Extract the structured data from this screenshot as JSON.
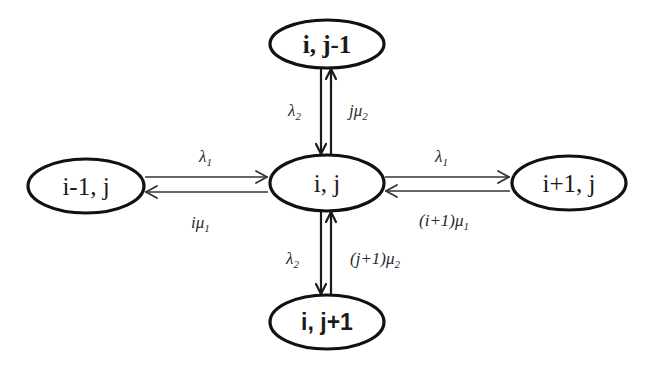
{
  "diagram": {
    "type": "state-transition",
    "nodes": [
      {
        "id": "top",
        "label": "i, j-1",
        "cx": 327,
        "cy": 44
      },
      {
        "id": "center",
        "label": "i, j",
        "cx": 327,
        "cy": 183
      },
      {
        "id": "left",
        "label": "i-1, j",
        "cx": 86,
        "cy": 186
      },
      {
        "id": "right",
        "label": "i+1, j",
        "cx": 569,
        "cy": 183
      },
      {
        "id": "bottom",
        "label": "i, j+1",
        "cx": 327,
        "cy": 322
      }
    ],
    "edges": [
      {
        "from": "top",
        "to": "center",
        "label": "λ₂"
      },
      {
        "from": "center",
        "to": "top",
        "label": "jμ₂"
      },
      {
        "from": "left",
        "to": "center",
        "label": "λ₁"
      },
      {
        "from": "center",
        "to": "left",
        "label": "iμ₁"
      },
      {
        "from": "center",
        "to": "right",
        "label": "λ₁"
      },
      {
        "from": "right",
        "to": "center",
        "label": "(i+1)μ₁"
      },
      {
        "from": "center",
        "to": "bottom",
        "label": "λ₂"
      },
      {
        "from": "bottom",
        "to": "center",
        "label": "(j+1)μ₂"
      }
    ]
  },
  "labels": {
    "node_top": "i, j-1",
    "node_center": "i, j",
    "node_left": "i-1, j",
    "node_right": "i+1, j",
    "node_bottom": "i, j+1",
    "rate_top_down": "λ",
    "rate_top_down_sub": "2",
    "rate_top_up": "jμ",
    "rate_top_up_sub": "2",
    "rate_left_right": "λ",
    "rate_left_right_sub": "1",
    "rate_left_back": "iμ",
    "rate_left_back_sub": "1",
    "rate_right_fwd": "λ",
    "rate_right_fwd_sub": "1",
    "rate_right_back": "(i+1)μ",
    "rate_right_back_sub": "1",
    "rate_bottom_down": "λ",
    "rate_bottom_down_sub": "2",
    "rate_bottom_up": "(j+1)μ",
    "rate_bottom_up_sub": "2"
  },
  "colors": {
    "background": "#ffffff",
    "stroke": "#111111",
    "text": "#1a1a1a"
  }
}
